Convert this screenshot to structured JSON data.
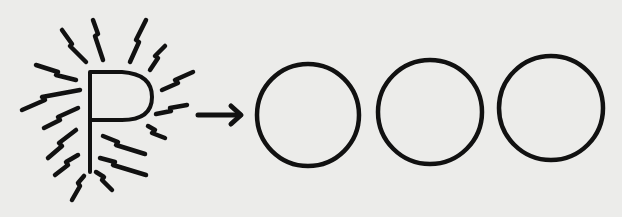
{
  "diagram": {
    "letter": "P",
    "colors": {
      "ink": "#111111",
      "paper": "#ececea"
    },
    "circles": [
      {
        "cx": 308,
        "cy": 115,
        "r": 51
      },
      {
        "cx": 430,
        "cy": 112,
        "r": 52
      },
      {
        "cx": 551,
        "cy": 108,
        "r": 52
      }
    ],
    "arrow": {
      "x1": 198,
      "y1": 115,
      "x2": 242,
      "y2": 115
    }
  }
}
